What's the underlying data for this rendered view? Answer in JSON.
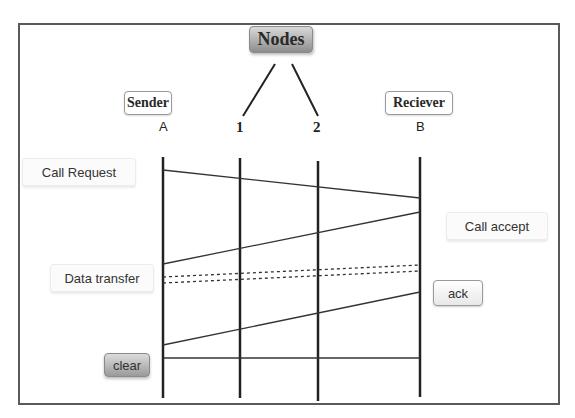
{
  "title": "Nodes",
  "participants": {
    "sender": {
      "label": "Sender",
      "id": "A"
    },
    "node1": {
      "id": "1"
    },
    "node2": {
      "id": "2"
    },
    "receiver": {
      "label": "Reciever",
      "id": "B"
    }
  },
  "messages": [
    {
      "label": "Call Request",
      "from": "A",
      "to": "B",
      "style": "solid"
    },
    {
      "label": "Call accept",
      "from": "B",
      "to": "A",
      "style": "solid"
    },
    {
      "label": "Data transfer",
      "from": "A",
      "to": "B",
      "style": "dotted",
      "count": 2
    },
    {
      "label": "ack",
      "from": "B",
      "to": "A",
      "style": "solid"
    },
    {
      "label": "clear",
      "from": "A",
      "to": "B",
      "style": "solid"
    }
  ],
  "colors": {
    "line": "#222222",
    "frame": "#5a5a5a",
    "title_box": "#a8a8a8"
  }
}
